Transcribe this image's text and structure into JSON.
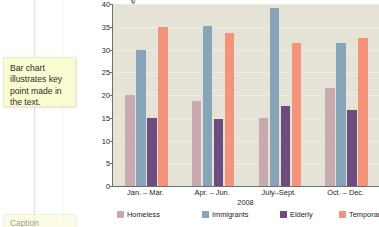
{
  "notes": [
    {
      "id": "main",
      "text": "Bar chart illustrates key point made in the text."
    },
    {
      "id": "caption",
      "text": "Caption"
    }
  ],
  "chart_data": {
    "type": "bar",
    "title": "",
    "subtitle": "",
    "xlabel": "2008",
    "ylabel": "Percentage of Total Number",
    "categories": [
      "Jan. – Mar.",
      "Apr. – Jun.",
      "July–Sept.",
      "Oct. – Dec."
    ],
    "series": [
      {
        "name": "Homeless",
        "color": "#c6aab0",
        "values": [
          20.0,
          18.6,
          14.9,
          21.5
        ]
      },
      {
        "name": "Immigrants",
        "color": "#88a4b8",
        "values": [
          30.0,
          35.1,
          39.2,
          31.5
        ]
      },
      {
        "name": "Elderly",
        "color": "#6d4b7e",
        "values": [
          15.0,
          14.7,
          17.6,
          16.6
        ]
      },
      {
        "name": "Temporary",
        "color": "#f3947a",
        "values": [
          35.0,
          33.6,
          31.4,
          32.6
        ]
      }
    ],
    "ylim": [
      0,
      40
    ],
    "yticks": [
      0,
      5,
      10,
      15,
      20,
      25,
      30,
      35,
      40
    ],
    "ytick_labels": [
      "0",
      "5",
      "10",
      "15",
      "20",
      "25",
      "30",
      "35",
      "40"
    ],
    "grid": true,
    "legend_position": "bottom",
    "plot_background": "#e5e3d5"
  }
}
